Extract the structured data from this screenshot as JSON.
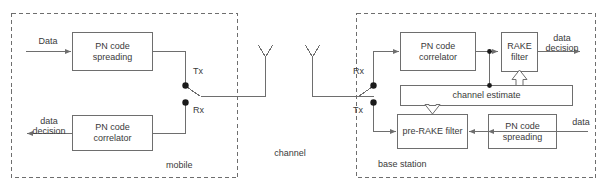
{
  "diagram": {
    "stroke_color": "#6e6e6e",
    "text_color": "#3a3a3a",
    "background": "#ffffff"
  },
  "regions": {
    "mobile": {
      "label": "mobile"
    },
    "channel": {
      "label": "channel"
    },
    "base_station": {
      "label": "base station"
    }
  },
  "mobile": {
    "input_label": "Data",
    "spreading_block": {
      "line1": "PN code",
      "line2": "spreading"
    },
    "correlator_block": {
      "line1": "PN code",
      "line2": "correlator"
    },
    "output_label": {
      "line1": "data",
      "line2": "decision"
    },
    "tx_label": "Tx",
    "rx_label": "Rx"
  },
  "base": {
    "rx_label": "Rx",
    "tx_label": "Tx",
    "correlator_block": {
      "line1": "PN code",
      "line2": "correlator"
    },
    "rake_block": {
      "line1": "RAKE",
      "line2": "filter"
    },
    "output_label": {
      "line1": "data",
      "line2": "decision"
    },
    "channel_estimate_block": {
      "line1": "channel estimate"
    },
    "prerake_block": {
      "line1": "pre-RAKE filter"
    },
    "spreading_block": {
      "line1": "PN code",
      "line2": "spreading"
    },
    "input_label": "data"
  }
}
